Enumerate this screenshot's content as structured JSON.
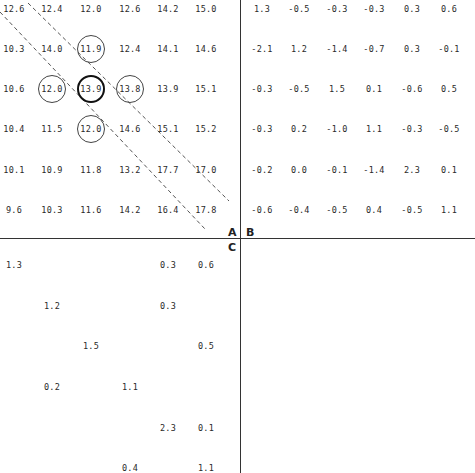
{
  "quadrant_labels": {
    "A": "A",
    "B": "B",
    "C": "C"
  },
  "colors": {
    "ink": "#2a2a2a",
    "line": "#333333",
    "background": "#ffffff"
  },
  "grid_A": {
    "rows": [
      [
        "12.6",
        "12.4",
        "12.0",
        "12.6",
        "14.2",
        "15.0"
      ],
      [
        "10.3",
        "14.0",
        "11.9",
        "12.4",
        "14.1",
        "14.6"
      ],
      [
        "10.6",
        "12.0",
        "13.9",
        "13.8",
        "13.9",
        "15.1"
      ],
      [
        "10.4",
        "11.5",
        "12.0",
        "14.6",
        "15.1",
        "15.2"
      ],
      [
        "10.1",
        "10.9",
        "11.8",
        "13.2",
        "17.7",
        "17.0"
      ],
      [
        "9.6",
        "10.3",
        "11.6",
        "14.2",
        "16.4",
        "17.8"
      ]
    ],
    "circled": [
      [
        1,
        2
      ],
      [
        2,
        1
      ],
      [
        2,
        3
      ],
      [
        3,
        2
      ]
    ],
    "bold_circled": [
      [
        2,
        2
      ]
    ]
  },
  "grid_B": {
    "rows": [
      [
        "1.3",
        "-0.5",
        "-0.3",
        "-0.3",
        "0.3",
        "0.6"
      ],
      [
        "-2.1",
        "1.2",
        "-1.4",
        "-0.7",
        "0.3",
        "-0.1"
      ],
      [
        "-0.3",
        "-0.5",
        "1.5",
        "0.1",
        "-0.6",
        "0.5"
      ],
      [
        "-0.3",
        "0.2",
        "-1.0",
        "1.1",
        "-0.3",
        "-0.5"
      ],
      [
        "-0.2",
        "0.0",
        "-0.1",
        "-1.4",
        "2.3",
        "0.1"
      ],
      [
        "-0.6",
        "-0.4",
        "-0.5",
        "0.4",
        "-0.5",
        "1.1"
      ]
    ]
  },
  "grid_C": {
    "rows": [
      [
        "1.3",
        "",
        "",
        "",
        "0.3",
        "0.6"
      ],
      [
        "",
        "1.2",
        "",
        "",
        "0.3",
        ""
      ],
      [
        "",
        "",
        "1.5",
        "",
        "",
        "0.5"
      ],
      [
        "",
        "0.2",
        "",
        "1.1",
        "",
        ""
      ],
      [
        "",
        "",
        "",
        "",
        "2.3",
        "0.1"
      ],
      [
        "",
        "",
        "",
        "0.4",
        "",
        "1.1"
      ]
    ]
  }
}
